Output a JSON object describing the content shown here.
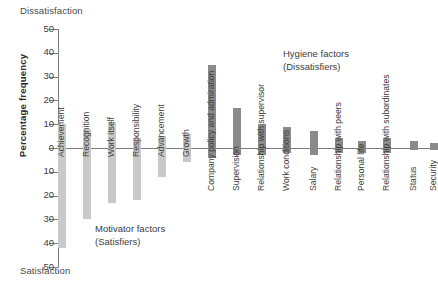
{
  "axis": {
    "y_title": "Percentage frequency",
    "pole_top": "Dissatisfaction",
    "pole_bottom": "Satisfaction",
    "ticks": [
      "50",
      "40",
      "30",
      "20",
      "10",
      "0",
      "10",
      "20",
      "30",
      "40",
      "50"
    ]
  },
  "annotations": {
    "motivator_line1": "Motivator factors",
    "motivator_line2": "(Satisfiers)",
    "hygiene_line1": "Hygiene factors",
    "hygiene_line2": "(Dissatisfiers)"
  },
  "colors": {
    "motivator": "#c9c9c9",
    "hygiene": "#8a8a8a",
    "axis": "#7d7d7d"
  },
  "chart_data": {
    "type": "bar",
    "title": "",
    "subtitle": "",
    "xlabel": "",
    "ylabel": "Percentage frequency",
    "ylim": [
      -50,
      50
    ],
    "grid": false,
    "legend_position": "none",
    "axis_top_label": "Dissatisfaction",
    "axis_bottom_label": "Satisfaction",
    "note": "Herzberg two-factor theory: positive values extend toward Dissatisfaction, negative values toward Satisfaction",
    "categories": [
      "Achievement",
      "Recognition",
      "Work itself",
      "Responsibility",
      "Advancement",
      "Growth",
      "Company policy and admiration",
      "Supervision",
      "Relationship with supervisor",
      "Work conditions",
      "Salary",
      "Relationship with peers",
      "Personal life",
      "Relationship with subordinates",
      "Status",
      "Security"
    ],
    "groups": [
      "Motivator factors (Satisfiers)",
      "Motivator factors (Satisfiers)",
      "Motivator factors (Satisfiers)",
      "Motivator factors (Satisfiers)",
      "Motivator factors (Satisfiers)",
      "Motivator factors (Satisfiers)",
      "Hygiene factors (Dissatisfiers)",
      "Hygiene factors (Dissatisfiers)",
      "Hygiene factors (Dissatisfiers)",
      "Hygiene factors (Dissatisfiers)",
      "Hygiene factors (Dissatisfiers)",
      "Hygiene factors (Dissatisfiers)",
      "Hygiene factors (Dissatisfiers)",
      "Hygiene factors (Dissatisfiers)",
      "Hygiene factors (Dissatisfiers)",
      "Hygiene factors (Dissatisfiers)"
    ],
    "series": [
      {
        "name": "Dissatisfaction (positive)",
        "values": [
          10,
          8,
          11,
          4,
          5,
          6,
          35,
          17,
          10,
          9,
          7,
          4,
          3,
          4,
          3,
          2
        ]
      },
      {
        "name": "Satisfaction (negative)",
        "values": [
          -42,
          -30,
          -23,
          -22,
          -12,
          -6,
          -4,
          -3,
          -3,
          -2,
          -3,
          -2,
          -2,
          -2,
          -1,
          -1
        ]
      }
    ]
  },
  "bars": [
    {
      "label": "Achievement",
      "group": "motivator",
      "pos": 10,
      "neg": -42,
      "x": 0
    },
    {
      "label": "Recognition",
      "group": "motivator",
      "pos": 8,
      "neg": -30,
      "x": 25
    },
    {
      "label": "Work itself",
      "group": "motivator",
      "pos": 11,
      "neg": -23,
      "x": 50
    },
    {
      "label": "Responsibility",
      "group": "motivator",
      "pos": 4,
      "neg": -22,
      "x": 75
    },
    {
      "label": "Advancement",
      "group": "motivator",
      "pos": 5,
      "neg": -12,
      "x": 100
    },
    {
      "label": "Growth",
      "group": "motivator",
      "pos": 6,
      "neg": -6,
      "x": 125
    },
    {
      "label": "Company policy and admiration",
      "group": "hygiene",
      "pos": 35,
      "neg": -4,
      "x": 150
    },
    {
      "label": "Supervision",
      "group": "hygiene",
      "pos": 17,
      "neg": -3,
      "x": 175
    },
    {
      "label": "Relationship with supervisor",
      "group": "hygiene",
      "pos": 10,
      "neg": -3,
      "x": 200
    },
    {
      "label": "Work conditions",
      "group": "hygiene",
      "pos": 9,
      "neg": -2,
      "x": 225
    },
    {
      "label": "Salary",
      "group": "hygiene",
      "pos": 7,
      "neg": -3,
      "x": 252
    },
    {
      "label": "Relationship with peers",
      "group": "hygiene",
      "pos": 4,
      "neg": -2,
      "x": 277
    },
    {
      "label": "Personal life",
      "group": "hygiene",
      "pos": 3,
      "neg": -2,
      "x": 300
    },
    {
      "label": "Relationship with subordinates",
      "group": "hygiene",
      "pos": 4,
      "neg": -2,
      "x": 325
    },
    {
      "label": "Status",
      "group": "hygiene",
      "pos": 3,
      "neg": -1,
      "x": 352
    },
    {
      "label": "Security",
      "group": "hygiene",
      "pos": 2,
      "neg": -1,
      "x": 372
    }
  ],
  "label_offsets": [
    {
      "top": 118
    },
    {
      "top": 118
    },
    {
      "top": 118
    },
    {
      "top": 118
    },
    {
      "top": 118
    },
    {
      "top": 118
    },
    {
      "top": 152
    },
    {
      "top": 152
    },
    {
      "top": 152
    },
    {
      "top": 152
    },
    {
      "top": 152
    },
    {
      "top": 152
    },
    {
      "top": 152
    },
    {
      "top": 152
    },
    {
      "top": 152
    },
    {
      "top": 152
    }
  ]
}
